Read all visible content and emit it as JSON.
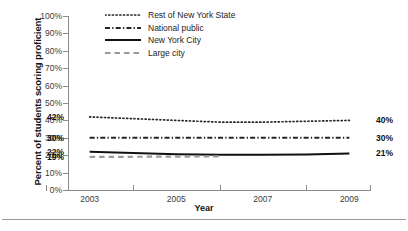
{
  "chart_data": {
    "type": "line",
    "title": "",
    "subtitle": "",
    "xlabel": "Year",
    "ylabel": "Percent of students scoring proficient",
    "x": [
      2003,
      2004,
      2005,
      2006,
      2007,
      2008,
      2009
    ],
    "xtick_labels": [
      "2003",
      "2005",
      "2007",
      "2009"
    ],
    "xtick_values": [
      2003,
      2005,
      2007,
      2009
    ],
    "ytick_labels": [
      "100%",
      "90%",
      "80%",
      "70%",
      "60%",
      "50%",
      "40%",
      "30%",
      "20%",
      "10%",
      "0%"
    ],
    "ytick_values": [
      100,
      90,
      80,
      70,
      60,
      50,
      40,
      30,
      20,
      10,
      0
    ],
    "ylim": [
      0,
      100
    ],
    "xlim": [
      2002.5,
      2009.5
    ],
    "grid": false,
    "legend_position": "top-center",
    "series": [
      {
        "name": "Rest of New York State",
        "style": "dotted",
        "color": "#262626",
        "values": [
          42,
          41,
          40,
          39,
          39,
          39.5,
          40
        ],
        "start_label": "42%",
        "end_label": "40%"
      },
      {
        "name": "National public",
        "style": "dash-dot",
        "color": "#262626",
        "values": [
          30,
          30,
          30,
          30,
          30,
          30,
          30
        ],
        "start_label": "30%",
        "end_label": "30%"
      },
      {
        "name": "New York City",
        "style": "solid",
        "color": "#111111",
        "values": [
          22,
          21.3,
          20.6,
          20.3,
          20.2,
          20.4,
          21
        ],
        "start_label": "22%",
        "end_label": "21%"
      },
      {
        "name": "Large city",
        "style": "dashed",
        "color": "#9a9a9a",
        "values": [
          19,
          19.1,
          19.2,
          19.3,
          null,
          null,
          null
        ],
        "start_label": "19%",
        "end_label": ""
      }
    ]
  },
  "legend": {
    "items": [
      {
        "label": "Rest of New York State",
        "style": "dotted",
        "color": "#262626"
      },
      {
        "label": "National public",
        "style": "dash-dot",
        "color": "#262626"
      },
      {
        "label": "New York City",
        "style": "solid",
        "color": "#111111"
      },
      {
        "label": "Large city",
        "style": "dashed",
        "color": "#9a9a9a"
      }
    ]
  },
  "value_labels": {
    "left": [
      {
        "text": "42%",
        "series": "Rest of New York State"
      },
      {
        "text": "30%",
        "series": "National public"
      },
      {
        "text": "22%",
        "series": "New York City"
      },
      {
        "text": "19%",
        "series": "Large city"
      }
    ],
    "right": [
      {
        "text": "40%",
        "series": "Rest of New York State"
      },
      {
        "text": "30%",
        "series": "National public"
      },
      {
        "text": "21%",
        "series": "New York City"
      }
    ]
  }
}
